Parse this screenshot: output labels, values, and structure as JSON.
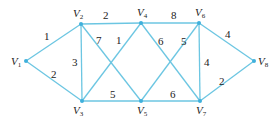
{
  "diagram": {
    "type": "weighted-undirected-graph",
    "edge_color": "#6cc6e2",
    "node_color": "#3fb0dc",
    "nodes": [
      {
        "id": "V1",
        "letter": "V",
        "sub": "1",
        "x": 26,
        "y": 61,
        "lx": 11,
        "ly": 65
      },
      {
        "id": "V2",
        "letter": "V",
        "sub": "2",
        "x": 81,
        "y": 24,
        "lx": 73,
        "ly": 17
      },
      {
        "id": "V3",
        "letter": "V",
        "sub": "3",
        "x": 82,
        "y": 101,
        "lx": 73,
        "ly": 114
      },
      {
        "id": "V4",
        "letter": "V",
        "sub": "4",
        "x": 141,
        "y": 23,
        "lx": 137,
        "ly": 16
      },
      {
        "id": "V5",
        "letter": "V",
        "sub": "5",
        "x": 141,
        "y": 101,
        "lx": 137,
        "ly": 114
      },
      {
        "id": "V6",
        "letter": "V",
        "sub": "6",
        "x": 199,
        "y": 23,
        "lx": 195,
        "ly": 16
      },
      {
        "id": "V7",
        "letter": "V",
        "sub": "7",
        "x": 200,
        "y": 101,
        "lx": 196,
        "ly": 114
      },
      {
        "id": "V8",
        "letter": "V",
        "sub": "8",
        "x": 254,
        "y": 61,
        "lx": 258,
        "ly": 65
      }
    ],
    "edges": [
      {
        "from": "V1",
        "to": "V2",
        "weight": "1",
        "wx": 44,
        "wy": 40
      },
      {
        "from": "V1",
        "to": "V3",
        "weight": "2",
        "wx": 51,
        "wy": 78
      },
      {
        "from": "V2",
        "to": "V4",
        "weight": "2",
        "wx": 103,
        "wy": 19
      },
      {
        "from": "V2",
        "to": "V3",
        "weight": "3",
        "wx": 72,
        "wy": 66
      },
      {
        "from": "V2",
        "to": "V5",
        "weight": "7",
        "wx": 96,
        "wy": 44
      },
      {
        "from": "V3",
        "to": "V4",
        "weight": "1",
        "wx": 116,
        "wy": 44
      },
      {
        "from": "V3",
        "to": "V5",
        "weight": "5",
        "wx": 110,
        "wy": 98
      },
      {
        "from": "V4",
        "to": "V6",
        "weight": "8",
        "wx": 171,
        "wy": 19
      },
      {
        "from": "V4",
        "to": "V7",
        "weight": "6",
        "wx": 158,
        "wy": 45
      },
      {
        "from": "V5",
        "to": "V6",
        "weight": "5",
        "wx": 181,
        "wy": 45
      },
      {
        "from": "V5",
        "to": "V7",
        "weight": "6",
        "wx": 170,
        "wy": 98
      },
      {
        "from": "V6",
        "to": "V7",
        "weight": "4",
        "wx": 204,
        "wy": 66
      },
      {
        "from": "V6",
        "to": "V8",
        "weight": "4",
        "wx": 225,
        "wy": 38
      },
      {
        "from": "V7",
        "to": "V8",
        "weight": "2",
        "wx": 219,
        "wy": 85
      }
    ]
  }
}
